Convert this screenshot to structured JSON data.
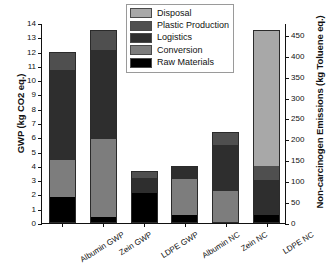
{
  "chart_data": {
    "type": "bar",
    "subtype": "stacked",
    "title": "",
    "xlabel": "",
    "ylabel": "GWP (kg CO2 eq.)",
    "y2label": "Non-carcinogen Emissions (kg Toluene eq.)",
    "categories": [
      "Albumin GWP",
      "Zein GWP",
      "LDPE GWP",
      "Albumin NC",
      "Zein NC",
      "LDPE NC"
    ],
    "ylim": [
      0,
      14
    ],
    "yticks": [
      0,
      1,
      2,
      3,
      4,
      5,
      6,
      7,
      8,
      9,
      10,
      11,
      12,
      13,
      14
    ],
    "yticklabels": [
      "0",
      "1",
      "2",
      "3",
      "4",
      "5",
      "6",
      "7",
      "8",
      "9",
      "10",
      "11",
      "12",
      "13",
      "14"
    ],
    "y2lim": [
      0,
      478.33
    ],
    "y2ticks": [
      0,
      50,
      100,
      150,
      200,
      250,
      300,
      350,
      400,
      450
    ],
    "y2ticklabels": [
      "0",
      "50",
      "100",
      "150",
      "200",
      "250",
      "300",
      "350",
      "400",
      "450"
    ],
    "grid": false,
    "legend_position": "top-center",
    "series": [
      {
        "name": "Raw Materials",
        "color": "#000000",
        "values": [
          1.85,
          0.42,
          2.12,
          0.55,
          0.1,
          0.55
        ]
      },
      {
        "name": "Conversion",
        "color": "#7d7d7d",
        "values": [
          2.55,
          5.48,
          0.0,
          2.55,
          2.15,
          0.0
        ]
      },
      {
        "name": "Logistics",
        "color": "#2e2e2e",
        "values": [
          6.3,
          6.2,
          1.0,
          0.9,
          3.2,
          2.45
        ]
      },
      {
        "name": "Plastic Production",
        "color": "#4f4f4f",
        "values": [
          1.3,
          1.4,
          0.5,
          0.0,
          0.9,
          1.0
        ]
      },
      {
        "name": "Disposal",
        "color": "#a8a8a8",
        "values": [
          0.0,
          0.0,
          0.0,
          0.0,
          0.0,
          9.5
        ]
      }
    ],
    "totals": [
      12.0,
      13.5,
      3.62,
      4.0,
      6.35,
      13.5
    ],
    "legend_order": [
      "Disposal",
      "Plastic Production",
      "Logistics",
      "Conversion",
      "Raw Materials"
    ]
  },
  "legend": {
    "items": [
      {
        "label": "Disposal",
        "color": "#a8a8a8"
      },
      {
        "label": "Plastic Production",
        "color": "#4f4f4f"
      },
      {
        "label": "Logistics",
        "color": "#2e2e2e"
      },
      {
        "label": "Conversion",
        "color": "#7d7d7d"
      },
      {
        "label": "Raw Materials",
        "color": "#000000"
      }
    ]
  }
}
